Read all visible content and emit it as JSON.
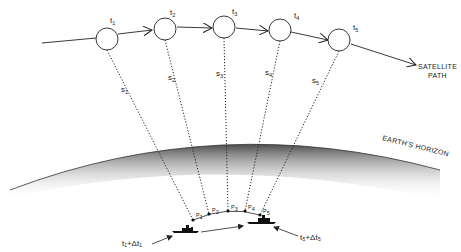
{
  "diagram": {
    "satellite_path_label": [
      "SATELLITE",
      "PATH"
    ],
    "horizon_label": "EARTH'S HORIZON",
    "satellite_positions": [
      {
        "label": "t",
        "sub": "1"
      },
      {
        "label": "t",
        "sub": "2"
      },
      {
        "label": "t",
        "sub": "3"
      },
      {
        "label": "t",
        "sub": "4"
      },
      {
        "label": "t",
        "sub": "5"
      }
    ],
    "ranges": [
      {
        "label": "s",
        "sub": "1"
      },
      {
        "label": "s",
        "sub": "2"
      },
      {
        "label": "s",
        "sub": "3"
      },
      {
        "label": "s",
        "sub": "4"
      },
      {
        "label": "s",
        "sub": "5"
      }
    ],
    "ground_points": [
      {
        "label": "P",
        "sub": "1"
      },
      {
        "label": "P",
        "sub": "2"
      },
      {
        "label": "P",
        "sub": "3"
      },
      {
        "label": "P",
        "sub": "4"
      },
      {
        "label": "P",
        "sub": "5"
      }
    ],
    "ship_start_label": "t₁+Δt₁",
    "ship_end_label": "t₅+Δt₅",
    "colors": {
      "line": "#222222",
      "earth_shadow": "#555555",
      "background": "#ffffff"
    }
  }
}
